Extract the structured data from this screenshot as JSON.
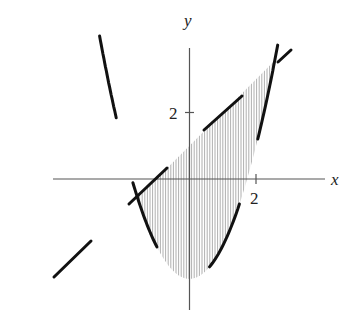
{
  "figure": {
    "title_fragment": "",
    "x_axis_label": "x",
    "y_axis_label": "y",
    "x_tick_label": "2",
    "y_tick_label": "2",
    "colors": {
      "axis": "#555555",
      "curve": "#111111",
      "shading": "#9a9a9a",
      "background": "#ffffff"
    }
  },
  "chart_data": {
    "type": "region-plot",
    "title": "",
    "xlabel": "x",
    "ylabel": "y",
    "curves": [
      {
        "name": "parabola",
        "equation": "y = x^2 - 3",
        "style": "long-dashed thick"
      },
      {
        "name": "line",
        "equation": "y = x + 1",
        "style": "long-dashed thick"
      }
    ],
    "shaded_region": {
      "description": "region between y = x^2 - 3 (below) and y = x + 1 (above)",
      "x_range": [
        -1.56,
        2.56
      ],
      "fill": "vertical hatching"
    },
    "ticks": {
      "x": [
        2
      ],
      "y": [
        2
      ]
    },
    "grid": false,
    "legend": null
  }
}
